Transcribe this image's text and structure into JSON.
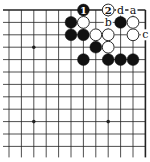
{
  "diagram": {
    "type": "go-board-fragment",
    "view": "top-right corner",
    "columns": 12,
    "rows": 12,
    "origin_x": 9,
    "origin_y": 10,
    "spacing": 12.4,
    "edges": {
      "top": true,
      "right": true,
      "left": false,
      "bottom": false
    },
    "colors": {
      "line": "#222222",
      "black_stone": "#111111",
      "white_stone": "#ffffff",
      "background": "#ffffff"
    },
    "star_points": [
      {
        "col": 2,
        "row": 3
      },
      {
        "col": 2,
        "row": 9
      },
      {
        "col": 8,
        "row": 9
      }
    ],
    "stones": [
      {
        "color": "black",
        "col": 6,
        "row": 0,
        "number": "1"
      },
      {
        "color": "white",
        "col": 8,
        "row": 0,
        "number": "2"
      },
      {
        "color": "black",
        "col": 5,
        "row": 1
      },
      {
        "color": "white",
        "col": 6,
        "row": 1
      },
      {
        "color": "black",
        "col": 9,
        "row": 1
      },
      {
        "color": "white",
        "col": 10,
        "row": 1
      },
      {
        "color": "black",
        "col": 5,
        "row": 2
      },
      {
        "color": "black",
        "col": 6,
        "row": 2
      },
      {
        "color": "white",
        "col": 7,
        "row": 2
      },
      {
        "color": "white",
        "col": 8,
        "row": 2
      },
      {
        "color": "white",
        "col": 10,
        "row": 2
      },
      {
        "color": "black",
        "col": 7,
        "row": 3
      },
      {
        "color": "white",
        "col": 8,
        "row": 3
      },
      {
        "color": "black",
        "col": 6,
        "row": 4
      },
      {
        "color": "black",
        "col": 8,
        "row": 4
      },
      {
        "color": "black",
        "col": 9,
        "row": 4
      },
      {
        "color": "black",
        "col": 10,
        "row": 4
      }
    ],
    "labels": [
      {
        "text": "d",
        "col": 9,
        "row": 0
      },
      {
        "text": "a",
        "col": 10,
        "row": 0
      },
      {
        "text": "b",
        "col": 8,
        "row": 1
      },
      {
        "text": "c",
        "col": 11,
        "row": 2
      }
    ]
  }
}
